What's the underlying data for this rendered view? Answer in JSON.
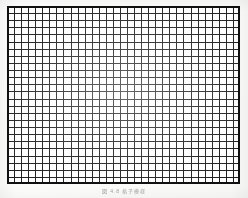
{
  "figure": {
    "kind": "grid-test-chart-scan",
    "caption": "図 4.8 格子模様",
    "caption_legible": false,
    "border_color": "#101010",
    "line_color": "#191919",
    "paper_color": "#fdfdfc",
    "plate": {
      "left_px": 7,
      "top_px": 6,
      "width_px": 233,
      "height_px": 178,
      "columns": 33,
      "rows": 25,
      "cell_width_px": 7.06,
      "cell_height_px": 7.12,
      "accent_every_n_cells": 5,
      "frame_thickness_px": 2.4
    }
  }
}
